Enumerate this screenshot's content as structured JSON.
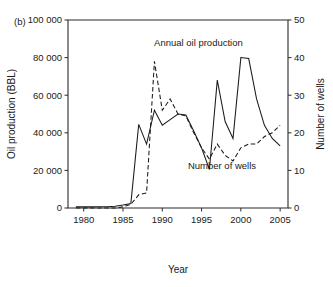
{
  "figure": {
    "panel_label": "(b)",
    "background": "#ffffff",
    "line_color": "#1a1a1a"
  },
  "chart_data": {
    "type": "line",
    "title": "",
    "xlabel": "Year",
    "ylabel": "Oil production (BBL)",
    "y2label": "Number of wells",
    "xlim": [
      1978,
      2006
    ],
    "ylim": [
      0,
      100000
    ],
    "y2lim": [
      0,
      50
    ],
    "xticks": [
      1980,
      1985,
      1990,
      1995,
      2000,
      2005
    ],
    "xticklabels": [
      "1980",
      "1985",
      "1990",
      "1995",
      "2000",
      "2005"
    ],
    "yticks": [
      0,
      20000,
      40000,
      60000,
      80000,
      100000
    ],
    "yticklabels": [
      "0",
      "20 000",
      "40 000",
      "60 000",
      "80 000",
      "100 000"
    ],
    "y2ticks": [
      0,
      10,
      20,
      30,
      40,
      50
    ],
    "y2ticklabels": [
      "0",
      "10",
      "20",
      "30",
      "40",
      "50"
    ],
    "grid": false,
    "legend_position": "inline-annotations",
    "annotations": [
      {
        "text": "Annual oil production",
        "x": 1994.6,
        "y": 88000
      },
      {
        "text": "Number of wells",
        "x": 1997.6,
        "y": 22500
      }
    ],
    "series": [
      {
        "name": "Annual oil production",
        "axis": "left",
        "style": "solid",
        "units": "BBL",
        "x": [
          1979,
          1980,
          1981,
          1982,
          1983,
          1984,
          1985,
          1986,
          1987,
          1988,
          1989,
          1990,
          1991,
          1992,
          1993,
          1994,
          1995,
          1996,
          1997,
          1998,
          1999,
          2000,
          2001,
          2002,
          2003,
          2004,
          2005
        ],
        "values": [
          600,
          600,
          600,
          650,
          700,
          900,
          1600,
          2400,
          44500,
          34000,
          52000,
          44000,
          47000,
          50000,
          49500,
          41000,
          32000,
          20500,
          68000,
          46000,
          37000,
          80000,
          79500,
          58000,
          44000,
          37000,
          33000
        ]
      },
      {
        "name": "Number of wells",
        "axis": "right",
        "style": "dashed",
        "units": "wells",
        "x": [
          1979,
          1980,
          1981,
          1982,
          1983,
          1984,
          1985,
          1986,
          1987,
          1988,
          1989,
          1990,
          1991,
          1992,
          1993,
          1994,
          1995,
          1996,
          1997,
          1998,
          1999,
          2000,
          2001,
          2002,
          2003,
          2004,
          2005
        ],
        "values": [
          0,
          0,
          0,
          0,
          0,
          0,
          0.3,
          1.0,
          3.5,
          4.0,
          39,
          26,
          29,
          25,
          24.5,
          20,
          16,
          13,
          17,
          14,
          12.5,
          16,
          17,
          17,
          19,
          20,
          22
        ]
      }
    ]
  },
  "plot_geometry": {
    "left": 68,
    "right": 288,
    "top": 20,
    "bottom": 208
  }
}
